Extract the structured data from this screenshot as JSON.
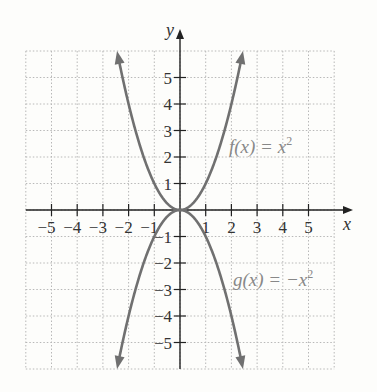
{
  "chart_data": {
    "type": "line",
    "title": "",
    "xlabel": "x",
    "ylabel": "y",
    "xlim": [
      -6,
      6
    ],
    "ylim": [
      -6,
      6
    ],
    "grid": true,
    "x_ticks": [
      -5,
      -4,
      -3,
      -2,
      -1,
      1,
      2,
      3,
      4,
      5
    ],
    "y_ticks": [
      -5,
      -4,
      -3,
      -2,
      -1,
      1,
      2,
      3,
      4,
      5
    ],
    "x_tick_labels": [
      "−5",
      "−4",
      "−3",
      "−2",
      "−1",
      "1",
      "2",
      "3",
      "4",
      "5"
    ],
    "y_tick_labels": [
      "−5",
      "−4",
      "−3",
      "−2",
      "−1",
      "1",
      "2",
      "3",
      "4",
      "5"
    ],
    "series": [
      {
        "name": "f(x) = x^2",
        "label": "f(x) = x2",
        "x": [
          -2.45,
          -2,
          -1.5,
          -1,
          -0.5,
          0,
          0.5,
          1,
          1.5,
          2,
          2.45
        ],
        "y": [
          6,
          4,
          2.25,
          1,
          0.25,
          0,
          0.25,
          1,
          2.25,
          4,
          6
        ],
        "color": "#707070"
      },
      {
        "name": "g(x) = -x^2",
        "label": "g(x) = −x2",
        "x": [
          -2.45,
          -2,
          -1.5,
          -1,
          -0.5,
          0,
          0.5,
          1,
          1.5,
          2,
          2.45
        ],
        "y": [
          -6,
          -4,
          -2.25,
          -1,
          -0.25,
          0,
          -0.25,
          -1,
          -2.25,
          -4,
          -6
        ],
        "color": "#707070"
      }
    ]
  },
  "labels": {
    "x_axis": "x",
    "y_axis": "y",
    "f_label_main": "f(x) = x",
    "f_label_exp": "2",
    "g_label_main": "g(x) = −x",
    "g_label_exp": "2"
  }
}
